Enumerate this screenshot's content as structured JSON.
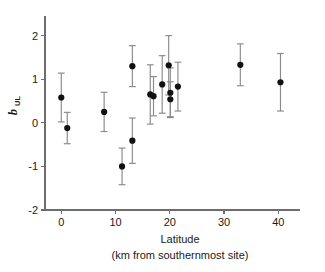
{
  "chart_data": {
    "type": "scatter",
    "title": "",
    "xlabel": "Latitude",
    "xlabel_line2": "(km from southernmost site)",
    "ylabel": "b",
    "ylabel_subscript": "UL",
    "xlim": [
      -3,
      44
    ],
    "ylim": [
      -2,
      2.45
    ],
    "xticks": [
      0,
      10,
      20,
      30,
      40
    ],
    "xticklabels": [
      "0",
      "10",
      "20",
      "30",
      "40"
    ],
    "yticks": [
      -2,
      -1,
      0,
      1,
      2
    ],
    "yticklabels": [
      "-2",
      "-1",
      "0",
      "1",
      "2"
    ],
    "grid": false,
    "legend": null,
    "error_bars": "symmetric vertical with caps",
    "marker_style": "filled circle",
    "marker_color": "#111111",
    "errorbar_color": "#8a8a8a",
    "axis_color": "#6d6d6d",
    "n_points": 15,
    "points": [
      {
        "x": 0.0,
        "y": 0.58,
        "err": 0.56
      },
      {
        "x": 1.1,
        "y": -0.12,
        "err": 0.36
      },
      {
        "x": 7.9,
        "y": 0.25,
        "err": 0.45
      },
      {
        "x": 11.2,
        "y": -1.0,
        "err": 0.42
      },
      {
        "x": 13.1,
        "y": -0.41,
        "err": 0.52
      },
      {
        "x": 13.1,
        "y": 1.3,
        "err": 0.47
      },
      {
        "x": 16.4,
        "y": 0.65,
        "err": 0.68
      },
      {
        "x": 17.0,
        "y": 0.61,
        "err": 0.45
      },
      {
        "x": 18.6,
        "y": 0.88,
        "err": 0.66
      },
      {
        "x": 19.8,
        "y": 1.32,
        "err": 0.68
      },
      {
        "x": 20.1,
        "y": 0.69,
        "err": 0.57
      },
      {
        "x": 20.1,
        "y": 0.54,
        "err": 0.4
      },
      {
        "x": 21.5,
        "y": 0.83,
        "err": 0.56
      },
      {
        "x": 33.0,
        "y": 1.33,
        "err": 0.48
      },
      {
        "x": 40.4,
        "y": 0.93,
        "err": 0.66
      }
    ]
  }
}
